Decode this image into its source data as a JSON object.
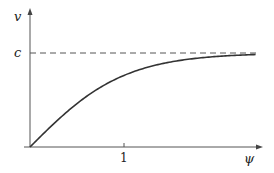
{
  "chart_data": {
    "type": "line",
    "title": "",
    "xlabel": "ψ",
    "ylabel": "v",
    "x_ticks": [
      {
        "value": 1,
        "label": "1"
      }
    ],
    "y_ticks": [
      {
        "value": 1,
        "label": "c"
      }
    ],
    "xlim": [
      0,
      2.45
    ],
    "ylim": [
      0,
      1.45
    ],
    "grid": false,
    "legend": null,
    "annotations": [
      {
        "type": "horizontal-asymptote",
        "label": "c",
        "y": 1,
        "style": "dashed"
      }
    ],
    "series": [
      {
        "name": "v(ψ)",
        "function": "c·tanh(ψ)",
        "x": [
          0,
          0.25,
          0.5,
          0.75,
          1.0,
          1.25,
          1.5,
          1.75,
          2.0,
          2.25,
          2.4
        ],
        "y": [
          0,
          0.245,
          0.462,
          0.635,
          0.762,
          0.848,
          0.905,
          0.941,
          0.964,
          0.978,
          0.984
        ]
      }
    ]
  },
  "labels": {
    "y_axis": "v",
    "x_axis": "ψ",
    "asymptote": "c",
    "tick_one": "1"
  }
}
